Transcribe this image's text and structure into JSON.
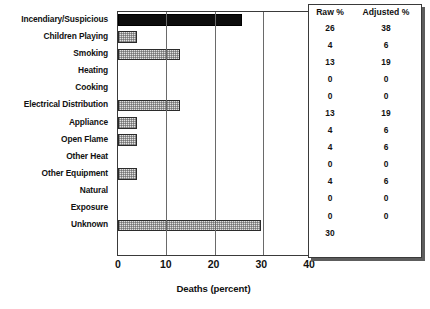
{
  "chart_data": {
    "type": "bar",
    "orientation": "horizontal",
    "title": "",
    "xlabel": "Deaths (percent)",
    "ylabel": "",
    "xlim": [
      0,
      40
    ],
    "xticks": [
      0,
      10,
      20,
      30,
      40
    ],
    "grid": true,
    "grid_axis": "x",
    "legend": false,
    "categories": [
      "Incendiary/Suspicious",
      "Children Playing",
      "Smoking",
      "Heating",
      "Cooking",
      "Electrical Distribution",
      "Appliance",
      "Open Flame",
      "Other Heat",
      "Other Equipment",
      "Natural",
      "Exposure",
      "Unknown"
    ],
    "values": [
      26,
      4,
      13,
      0,
      0,
      13,
      4,
      4,
      0,
      4,
      0,
      0,
      30
    ],
    "bar_styles": [
      "solid-black",
      "stipple",
      "stipple",
      "none",
      "none",
      "stipple",
      "stipple",
      "stipple",
      "none",
      "stipple",
      "none",
      "none",
      "stipple"
    ],
    "series": [
      {
        "name": "Deaths (percent)",
        "values": [
          26,
          4,
          13,
          0,
          0,
          13,
          4,
          4,
          0,
          4,
          0,
          0,
          30
        ]
      }
    ]
  },
  "axis": {
    "x_tick_labels": [
      "0",
      "10",
      "20",
      "30",
      "40"
    ],
    "x_title": "Deaths (percent)"
  },
  "categories": [
    {
      "label": "Incendiary/Suspicious"
    },
    {
      "label": "Children Playing"
    },
    {
      "label": "Smoking"
    },
    {
      "label": "Heating"
    },
    {
      "label": "Cooking"
    },
    {
      "label": "Electrical Distribution"
    },
    {
      "label": "Appliance"
    },
    {
      "label": "Open Flame"
    },
    {
      "label": "Other Heat"
    },
    {
      "label": "Other Equipment"
    },
    {
      "label": "Natural"
    },
    {
      "label": "Exposure"
    },
    {
      "label": "Unknown"
    }
  ],
  "table": {
    "headers": [
      "Raw %",
      "Adjusted %"
    ],
    "rows": [
      {
        "raw": "26",
        "adjusted": "38"
      },
      {
        "raw": "4",
        "adjusted": "6"
      },
      {
        "raw": "13",
        "adjusted": "19"
      },
      {
        "raw": "0",
        "adjusted": "0"
      },
      {
        "raw": "0",
        "adjusted": "0"
      },
      {
        "raw": "13",
        "adjusted": "19"
      },
      {
        "raw": "4",
        "adjusted": "6"
      },
      {
        "raw": "4",
        "adjusted": "6"
      },
      {
        "raw": "0",
        "adjusted": "0"
      },
      {
        "raw": "4",
        "adjusted": "6"
      },
      {
        "raw": "0",
        "adjusted": "0"
      },
      {
        "raw": "0",
        "adjusted": "0"
      },
      {
        "raw": "30",
        "adjusted": ""
      }
    ]
  },
  "colors": {
    "bar_fill": "#e2e2e2",
    "bar_solid": "#0d0d0d",
    "bar_border": "#2b2b2b",
    "axis": "#3a3a3a",
    "grid": "#6a6a6a",
    "text": "#111111"
  }
}
